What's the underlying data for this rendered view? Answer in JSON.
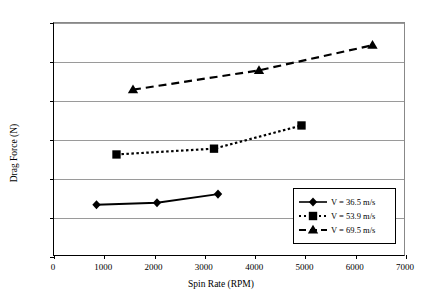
{
  "chart_data": {
    "type": "line",
    "title": "",
    "xlabel": "Spin Rate (RPM)",
    "ylabel": "Drag Force (N)",
    "xlim": [
      0,
      7000
    ],
    "ylim": [
      0,
      1.2
    ],
    "xticks": [
      0,
      1000,
      2000,
      3000,
      4000,
      5000,
      6000,
      7000
    ],
    "xtick_labels": [
      "0",
      "1000",
      "2000",
      "3000",
      "4000",
      "5000",
      "6000",
      "7000"
    ],
    "yticks": [
      0,
      0.2,
      0.4,
      0.6,
      0.8,
      1,
      1.2
    ],
    "ytick_labels": [
      "0",
      "0.2",
      "0.4",
      "0.6",
      "0.8",
      "1",
      "1.2"
    ],
    "grid": "horizontal",
    "legend_position": "inside-lower-right",
    "series": [
      {
        "name": "V = 36.5 m/s",
        "marker": "diamond",
        "linestyle": "solid",
        "color": "#000000",
        "x": [
          850,
          2060,
          3280
        ],
        "y": [
          0.26,
          0.27,
          0.315
        ]
      },
      {
        "name": "V = 53.9 m/s",
        "marker": "square",
        "linestyle": "dotted",
        "color": "#000000",
        "x": [
          1250,
          3200,
          4950
        ],
        "y": [
          0.52,
          0.55,
          0.67
        ]
      },
      {
        "name": "V = 69.5 m/s",
        "marker": "triangle",
        "linestyle": "dashed",
        "color": "#000000",
        "x": [
          1580,
          4100,
          6370
        ],
        "y": [
          0.855,
          0.955,
          1.085
        ]
      }
    ]
  }
}
